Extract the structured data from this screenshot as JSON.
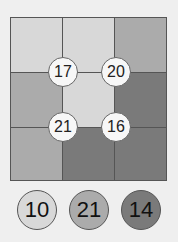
{
  "colors": {
    "light": "#d8d8d8",
    "medium": "#ababab",
    "dark": "#7a7a7a"
  },
  "grid": {
    "rows": [
      [
        "light",
        "light",
        "medium"
      ],
      [
        "medium",
        "light",
        "dark"
      ],
      [
        "medium",
        "dark",
        "dark"
      ]
    ]
  },
  "clues": [
    {
      "value": "17",
      "x": 63,
      "y": 72
    },
    {
      "value": "20",
      "x": 116,
      "y": 72
    },
    {
      "value": "21",
      "x": 63,
      "y": 127
    },
    {
      "value": "16",
      "x": 116,
      "y": 127
    }
  ],
  "palette": [
    {
      "value": "10",
      "color": "light",
      "x": 37,
      "y": 210
    },
    {
      "value": "21",
      "color": "medium",
      "x": 89,
      "y": 210
    },
    {
      "value": "14",
      "color": "dark",
      "x": 141,
      "y": 210
    }
  ]
}
